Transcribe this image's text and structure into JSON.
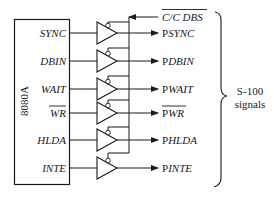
{
  "chip": {
    "name": "8080A",
    "pins": [
      {
        "label": "SYNC",
        "overbar": false
      },
      {
        "label": "DBIN",
        "overbar": false
      },
      {
        "label": "WAIT",
        "overbar": false
      },
      {
        "label": "WR",
        "overbar": true
      },
      {
        "label": "HLDA",
        "overbar": false
      },
      {
        "label": "INTE",
        "overbar": false
      }
    ]
  },
  "control": {
    "label": "C/C DBS",
    "overbar": true,
    "direction": "input"
  },
  "outputs": [
    {
      "prefix": "P",
      "label": "SYNC",
      "full": "PSYNC",
      "overbar": false
    },
    {
      "prefix": "P",
      "label": "DBIN",
      "full": "PDBIN",
      "overbar": false
    },
    {
      "prefix": "P",
      "label": "WAIT",
      "full": "PWAIT",
      "overbar": false
    },
    {
      "prefix": "P",
      "label": "WR",
      "full": "PWR",
      "overbar": true
    },
    {
      "prefix": "P",
      "label": "HLDA",
      "full": "PHLDA",
      "overbar": false
    },
    {
      "prefix": "P",
      "label": "INTE",
      "full": "PINTE",
      "overbar": false
    }
  ],
  "group": {
    "line1": "S-100",
    "line2": "signals"
  },
  "buffer": {
    "type": "tri-state",
    "enable": "active-low"
  },
  "colors": {
    "ink": "#1a1a1a",
    "background": "#ffffff"
  }
}
